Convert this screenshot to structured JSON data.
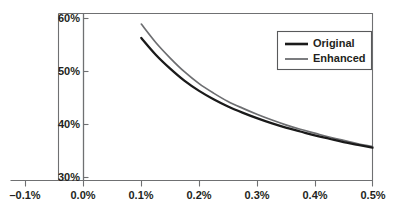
{
  "chart_data": {
    "type": "line",
    "title": "",
    "subtitle": "",
    "xlabel": "",
    "ylabel": "",
    "xlim": [
      -0.1,
      0.5
    ],
    "ylim": [
      30,
      60
    ],
    "grid": false,
    "legend_position": "top-right",
    "x_ticks": [
      -0.1,
      0.0,
      0.1,
      0.2,
      0.3,
      0.4,
      0.5
    ],
    "x_tick_labels": [
      "–0.1%",
      "0.0%",
      "0.1%",
      "0.2%",
      "0.3%",
      "0.4%",
      "0.5%"
    ],
    "y_ticks": [
      30,
      40,
      50,
      60
    ],
    "y_tick_labels": [
      "30%",
      "40%",
      "50%",
      "60%"
    ],
    "x": [
      0.1,
      0.125,
      0.15,
      0.175,
      0.2,
      0.225,
      0.25,
      0.275,
      0.3,
      0.325,
      0.35,
      0.375,
      0.4,
      0.425,
      0.45,
      0.475,
      0.5
    ],
    "series": [
      {
        "name": "Original",
        "color": "#1a1a1a",
        "values": [
          55.6,
          52.6,
          50.1,
          47.9,
          46.1,
          44.6,
          43.3,
          42.2,
          41.2,
          40.3,
          39.5,
          38.8,
          38.1,
          37.5,
          36.9,
          36.4,
          35.9
        ]
      },
      {
        "name": "Enhanced",
        "color": "#6d6e71",
        "values": [
          58.1,
          54.8,
          52.0,
          49.5,
          47.4,
          45.7,
          44.2,
          43.0,
          41.9,
          40.9,
          40.0,
          39.2,
          38.5,
          37.8,
          37.2,
          36.6,
          36.1
        ]
      }
    ]
  },
  "legend": {
    "entries": [
      {
        "label": "Original",
        "swatch": "original-line-swatch"
      },
      {
        "label": "Enhanced",
        "swatch": "enhanced-line-swatch"
      }
    ]
  },
  "colors": {
    "original": "#1a1a1a",
    "enhanced": "#6d6e71",
    "frame": "#6f7072",
    "text": "#231f20",
    "background": "#ffffff"
  },
  "axes": {
    "y_label_0": "60%",
    "y_label_1": "50%",
    "y_label_2": "40%",
    "y_label_3": "30%",
    "x_label_0": "–0.1%",
    "x_label_1": "0.0%",
    "x_label_2": "0.1%",
    "x_label_3": "0.2%",
    "x_label_4": "0.3%",
    "x_label_5": "0.4%",
    "x_label_6": "0.5%"
  }
}
